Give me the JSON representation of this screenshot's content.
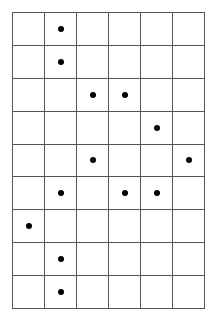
{
  "grid": {
    "rows": 9,
    "cols": 6,
    "line_color": "#555555",
    "dot_color": "#000000",
    "dots": [
      [
        0,
        1
      ],
      [
        1,
        1
      ],
      [
        2,
        2
      ],
      [
        2,
        3
      ],
      [
        3,
        4
      ],
      [
        4,
        2
      ],
      [
        4,
        5
      ],
      [
        5,
        1
      ],
      [
        5,
        3
      ],
      [
        5,
        4
      ],
      [
        6,
        0
      ],
      [
        7,
        1
      ],
      [
        8,
        1
      ]
    ]
  }
}
